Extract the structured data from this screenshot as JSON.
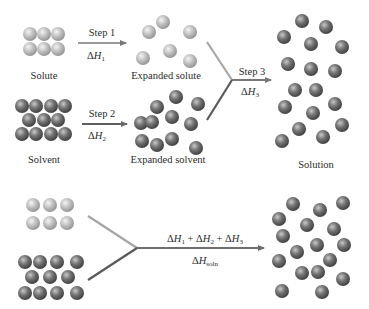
{
  "colors": {
    "solute_sphere": "#b9b9b9",
    "solvent_sphere": "#6e6e6e",
    "solute_line": "#a6a6a6",
    "solvent_line": "#5a5a5a",
    "arrow": "#777777",
    "text": "#2c2c2c"
  },
  "top": {
    "step1": {
      "label": "Step 1",
      "delta": "ΔH",
      "sub": "1"
    },
    "step2": {
      "label": "Step 2",
      "delta": "ΔH",
      "sub": "2"
    },
    "step3": {
      "label": "Step 3",
      "delta": "ΔH",
      "sub": "3"
    },
    "labels": {
      "solute": "Solute",
      "expanded_solute": "Expanded solute",
      "solvent": "Solvent",
      "expanded_solvent": "Expanded solvent",
      "solution": "Solution"
    }
  },
  "bottom": {
    "sum": {
      "t1": "ΔH",
      "s1": "1",
      "plus1": " + ",
      "t2": "ΔH",
      "s2": "2",
      "plus2": " + ",
      "t3": "ΔH",
      "s3": "3"
    },
    "total": {
      "delta": "ΔH",
      "sub": "soln"
    }
  }
}
